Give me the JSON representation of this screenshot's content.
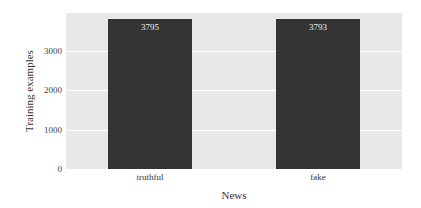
{
  "chart_data": {
    "type": "bar",
    "title": "",
    "xlabel": "News",
    "ylabel": "Training examples",
    "categories": [
      "truthful",
      "fake"
    ],
    "values": [
      3795,
      3793
    ],
    "data_labels": [
      "3795",
      "3793"
    ],
    "ylim": [
      0,
      3950
    ],
    "yticks": [
      0,
      1000,
      2000,
      3000
    ],
    "ytick_labels": [
      "0",
      "1000",
      "2000",
      "3000"
    ],
    "grid": true,
    "legend": null,
    "colors": {
      "bar": "#333333",
      "background": "#e8e8e8",
      "grid": "#ffffff",
      "label": "#f0f0f0"
    }
  }
}
